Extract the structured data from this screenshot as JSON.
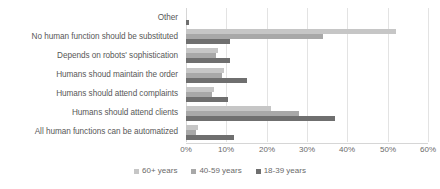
{
  "chart_data": {
    "type": "bar",
    "orientation": "horizontal",
    "title": "",
    "xlabel": "",
    "ylabel": "",
    "xlim": [
      0,
      60
    ],
    "xticks": [
      "0%",
      "10%",
      "20%",
      "30%",
      "40%",
      "50%",
      "60%"
    ],
    "xtick_values": [
      0,
      10,
      20,
      30,
      40,
      50,
      60
    ],
    "grid": true,
    "legend_position": "bottom",
    "categories": [
      "Other",
      "No human function should be substituted",
      "Depends on robots' sophistication",
      "Humans shoud maintain the order",
      "Humans should attend complaints",
      "Humans should attend clients",
      "All human functions can be automatized"
    ],
    "series": [
      {
        "name": "60+ years",
        "color": "#c6c6c6",
        "values": [
          0.0,
          52.0,
          8.0,
          9.5,
          7.0,
          21.0,
          3.0
        ]
      },
      {
        "name": "40-59 years",
        "color": "#a8a8a8",
        "values": [
          0.0,
          34.0,
          7.5,
          9.0,
          6.5,
          28.0,
          2.5
        ]
      },
      {
        "name": "18-39 years",
        "color": "#6f6f6f",
        "values": [
          0.7,
          11.0,
          11.0,
          15.0,
          10.5,
          37.0,
          12.0
        ]
      }
    ]
  },
  "legend": {
    "items": [
      {
        "label": "60+ years",
        "key": "s60"
      },
      {
        "label": "40-59 years",
        "key": "s40"
      },
      {
        "label": "18-39 years",
        "key": "s18"
      }
    ]
  }
}
